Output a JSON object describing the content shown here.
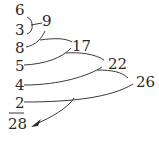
{
  "diagram": {
    "addends": [
      "6",
      "3",
      "8",
      "5",
      "4",
      "2"
    ],
    "partial_sums": [
      "9",
      "17",
      "22",
      "26"
    ],
    "total": "28",
    "line_color": "#3a3a3a",
    "text_color": "#2a2a2a"
  }
}
